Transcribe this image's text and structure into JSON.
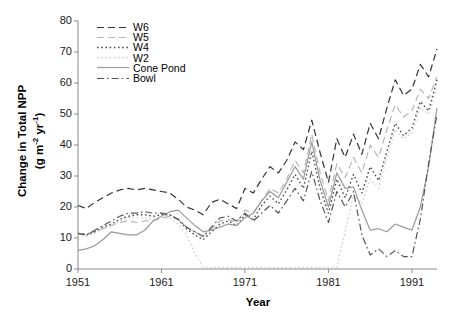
{
  "chart_data": {
    "type": "line",
    "title": "",
    "xlabel": "Year",
    "ylabel": "Change in Total NPP (g m-2 yr-1)",
    "ylabel_main": "Change in Total NPP",
    "ylabel_units": "(g m",
    "ylabel_units_sup1": "-2",
    "ylabel_units_mid": " yr",
    "ylabel_units_sup2": "-1",
    "ylabel_units_end": ")",
    "xlim": [
      1951,
      1994
    ],
    "ylim": [
      0,
      80
    ],
    "xticks": [
      1951,
      1961,
      1971,
      1981,
      1991
    ],
    "yticks": [
      0,
      10,
      20,
      30,
      40,
      50,
      60,
      70,
      80
    ],
    "xtick_labels": [
      "1951",
      "1961",
      "1971",
      "1981",
      "1991"
    ],
    "ytick_labels": [
      "0",
      "10",
      "20",
      "30",
      "40",
      "50",
      "60",
      "70",
      "80"
    ],
    "grid": false,
    "legend_position": "top-left-inside",
    "x": [
      1951,
      1952,
      1953,
      1954,
      1955,
      1956,
      1957,
      1958,
      1959,
      1960,
      1961,
      1962,
      1963,
      1964,
      1965,
      1966,
      1967,
      1968,
      1969,
      1970,
      1971,
      1972,
      1973,
      1974,
      1975,
      1976,
      1977,
      1978,
      1979,
      1980,
      1981,
      1982,
      1983,
      1984,
      1985,
      1986,
      1987,
      1988,
      1989,
      1990,
      1991,
      1992,
      1993,
      1994
    ],
    "series": [
      {
        "name": "W6",
        "style": "dashed",
        "color": "#333333",
        "values": [
          20.5,
          19.5,
          21.5,
          23.0,
          24.5,
          25.5,
          26.0,
          25.5,
          26.0,
          25.5,
          25.0,
          24.5,
          22.5,
          20.0,
          19.0,
          17.5,
          21.5,
          22.5,
          21.0,
          19.5,
          26.0,
          24.5,
          29.0,
          33.0,
          31.0,
          35.0,
          41.0,
          38.5,
          48.0,
          37.5,
          28.0,
          42.0,
          36.0,
          43.5,
          37.0,
          47.0,
          42.0,
          52.0,
          61.0,
          56.0,
          58.0,
          66.0,
          62.0,
          71.0
        ]
      },
      {
        "name": "W5",
        "style": "dashed-light",
        "color": "#b8b8b8",
        "values": [
          11.0,
          11.5,
          12.0,
          13.0,
          14.0,
          15.0,
          15.5,
          15.0,
          15.5,
          15.5,
          16.5,
          17.0,
          16.0,
          13.5,
          12.0,
          10.5,
          13.0,
          15.5,
          16.0,
          15.0,
          19.0,
          18.0,
          22.0,
          26.0,
          24.5,
          29.0,
          35.0,
          31.0,
          43.5,
          31.0,
          22.0,
          34.0,
          29.5,
          36.0,
          31.0,
          40.0,
          36.0,
          45.0,
          53.0,
          49.0,
          51.0,
          58.0,
          55.0,
          62.0
        ]
      },
      {
        "name": "W4",
        "style": "dotted",
        "color": "#4d4d4d",
        "values": [
          11.5,
          11.0,
          12.0,
          13.5,
          14.5,
          16.0,
          17.0,
          17.5,
          17.5,
          17.0,
          17.5,
          17.5,
          16.0,
          13.0,
          11.0,
          9.5,
          12.0,
          14.5,
          15.5,
          14.0,
          17.5,
          16.0,
          20.5,
          23.5,
          21.0,
          25.5,
          30.5,
          26.0,
          38.0,
          26.0,
          18.0,
          29.0,
          23.0,
          30.5,
          24.5,
          33.0,
          28.5,
          38.0,
          47.0,
          43.0,
          45.5,
          54.0,
          51.0,
          61.0
        ]
      },
      {
        "name": "W2",
        "style": "dotted-light",
        "color": "#d0d0d0",
        "values": [
          11.0,
          10.5,
          11.5,
          13.0,
          14.0,
          15.5,
          16.5,
          16.5,
          16.5,
          16.0,
          16.5,
          16.5,
          14.5,
          11.0,
          5.0,
          0.5,
          0.5,
          0.5,
          0.5,
          0.5,
          0.5,
          0.5,
          0.5,
          0.5,
          0.5,
          0.5,
          0.5,
          0.5,
          0.5,
          0.5,
          0.5,
          0.5,
          12.0,
          24.0,
          21.0,
          29.0,
          26.0,
          36.0,
          45.0,
          42.0,
          44.0,
          52.0,
          50.0,
          58.0
        ]
      },
      {
        "name": "Cone Pond",
        "style": "solid",
        "color": "#9a9a9a",
        "values": [
          6.0,
          6.5,
          7.5,
          9.5,
          12.0,
          11.5,
          11.0,
          11.0,
          12.5,
          15.5,
          17.0,
          18.5,
          19.0,
          16.5,
          14.0,
          12.0,
          12.5,
          13.5,
          14.5,
          14.0,
          16.5,
          18.0,
          22.0,
          25.0,
          23.0,
          28.0,
          33.0,
          29.0,
          41.0,
          28.5,
          20.0,
          31.0,
          26.0,
          26.5,
          19.0,
          12.5,
          13.0,
          12.0,
          14.5,
          13.5,
          12.5,
          20.0,
          33.0,
          52.0
        ]
      },
      {
        "name": "Bowl",
        "style": "dash-dot",
        "color": "#555555",
        "values": [
          11.5,
          11.0,
          12.5,
          14.0,
          15.5,
          17.0,
          18.0,
          18.0,
          18.5,
          18.0,
          18.0,
          17.5,
          16.0,
          13.5,
          12.0,
          10.5,
          13.5,
          16.5,
          17.0,
          15.5,
          18.0,
          15.5,
          18.0,
          20.5,
          18.0,
          22.0,
          26.0,
          22.0,
          31.5,
          22.0,
          15.0,
          25.0,
          20.0,
          25.0,
          11.0,
          4.5,
          6.5,
          4.0,
          6.0,
          4.0,
          4.0,
          16.0,
          34.0,
          50.0
        ]
      }
    ],
    "legend_entries": [
      {
        "label": "W6",
        "style": "dashed",
        "color": "#333333"
      },
      {
        "label": "W5",
        "style": "dashed-light",
        "color": "#b8b8b8"
      },
      {
        "label": "W4",
        "style": "dotted",
        "color": "#4d4d4d"
      },
      {
        "label": "W2",
        "style": "dotted-light",
        "color": "#d0d0d0"
      },
      {
        "label": "Cone Pond",
        "style": "solid",
        "color": "#9a9a9a"
      },
      {
        "label": "Bowl",
        "style": "dash-dot",
        "color": "#555555"
      }
    ]
  },
  "axis": {
    "line_color": "#8a8a8a"
  }
}
